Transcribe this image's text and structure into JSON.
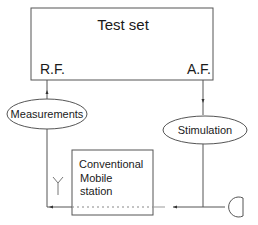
{
  "diagram": {
    "test_set": {
      "title": "Test set",
      "rf_label": "R.F.",
      "af_label": "A.F."
    },
    "measurements_label": "Measurements",
    "stimulation_label": "Stimulation",
    "mobile_station": {
      "line1": "Conventional",
      "line2": "Mobile",
      "line3": "station"
    },
    "icons": [
      "antenna-icon",
      "microphone-icon"
    ],
    "colors": {
      "line": "#555555",
      "text": "#1a1a1a",
      "background": "#ffffff"
    }
  }
}
